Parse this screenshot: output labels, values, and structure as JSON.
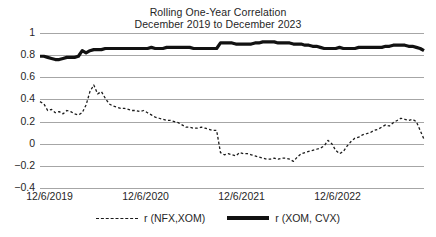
{
  "chart_data": {
    "type": "line",
    "title": "Rolling One-Year Correlation",
    "subtitle": "December 2019 to December 2023",
    "xlabel": "",
    "ylabel": "",
    "grid": true,
    "legend_position": "bottom",
    "ylim": [
      -0.4,
      1
    ],
    "yticks": [
      1,
      0.8,
      0.6,
      0.4,
      0.2,
      0,
      -0.2,
      -0.4
    ],
    "ytick_labels": [
      "1",
      "0.8",
      "0.6",
      "0.4",
      "0.2",
      "0",
      "−0.2",
      "−0.4"
    ],
    "xlim": [
      0,
      100
    ],
    "xticks": [
      2.5,
      27.5,
      52.5,
      77.5
    ],
    "xtick_labels": [
      "12/6/2019",
      "12/6/2020",
      "12/6/2021",
      "12/6/2022"
    ],
    "series": [
      {
        "name": "r (NFX,XOM)",
        "style": "dashed",
        "color": "#1a1a1a",
        "x": [
          0.0,
          1.0,
          2.0,
          3.0,
          4.0,
          5.0,
          6.0,
          7.0,
          8.0,
          9.0,
          10.0,
          11.0,
          12.0,
          13.0,
          14.0,
          15.0,
          16.0,
          17.0,
          18.0,
          19.0,
          20.0,
          21.0,
          22.0,
          23.0,
          24.0,
          25.0,
          26.0,
          27.0,
          28.0,
          29.0,
          30.0,
          31.0,
          32.0,
          33.0,
          34.0,
          35.0,
          36.0,
          37.0,
          38.0,
          39.0,
          40.0,
          41.0,
          42.0,
          43.0,
          44.0,
          45.0,
          46.0,
          47.0,
          48.0,
          49.0,
          50.0,
          51.0,
          52.0,
          53.0,
          54.0,
          55.0,
          56.0,
          57.0,
          58.0,
          59.0,
          60.0,
          61.0,
          62.0,
          63.0,
          64.0,
          65.0,
          66.0,
          67.0,
          68.0,
          69.0,
          70.0,
          71.0,
          72.0,
          73.0,
          74.0,
          75.0,
          76.0,
          77.0,
          78.0,
          79.0,
          80.0,
          81.0,
          82.0,
          83.0,
          84.0,
          85.0,
          86.0,
          87.0,
          88.0,
          89.0,
          90.0,
          91.0,
          92.0,
          93.0,
          94.0,
          95.0,
          96.0,
          97.0,
          98.0,
          99.0,
          100.0
        ],
        "values": [
          0.38,
          0.36,
          0.3,
          0.31,
          0.28,
          0.29,
          0.27,
          0.3,
          0.29,
          0.27,
          0.26,
          0.28,
          0.35,
          0.47,
          0.53,
          0.45,
          0.47,
          0.41,
          0.36,
          0.34,
          0.33,
          0.32,
          0.32,
          0.31,
          0.3,
          0.3,
          0.29,
          0.3,
          0.28,
          0.26,
          0.24,
          0.23,
          0.22,
          0.21,
          0.21,
          0.2,
          0.19,
          0.17,
          0.15,
          0.15,
          0.14,
          0.14,
          0.15,
          0.14,
          0.13,
          0.12,
          0.12,
          -0.08,
          -0.1,
          -0.09,
          -0.1,
          -0.11,
          -0.08,
          -0.09,
          -0.09,
          -0.1,
          -0.11,
          -0.12,
          -0.13,
          -0.14,
          -0.14,
          -0.13,
          -0.14,
          -0.13,
          -0.13,
          -0.14,
          -0.16,
          -0.12,
          -0.09,
          -0.08,
          -0.07,
          -0.06,
          -0.05,
          -0.04,
          -0.02,
          0.03,
          0.0,
          -0.06,
          -0.09,
          -0.07,
          -0.02,
          0.02,
          0.05,
          0.06,
          0.08,
          0.09,
          0.1,
          0.12,
          0.13,
          0.15,
          0.17,
          0.16,
          0.19,
          0.21,
          0.23,
          0.22,
          0.21,
          0.22,
          0.2,
          0.12,
          0.04
        ]
      },
      {
        "name": "r (XOM, CVX)",
        "style": "solid",
        "color": "#111111",
        "x": [
          0.0,
          1.0,
          2.0,
          3.0,
          4.0,
          5.0,
          6.0,
          7.0,
          8.0,
          9.0,
          10.0,
          11.0,
          12.0,
          13.0,
          14.0,
          15.0,
          16.0,
          17.0,
          18.0,
          19.0,
          20.0,
          21.0,
          22.0,
          23.0,
          24.0,
          25.0,
          26.0,
          27.0,
          28.0,
          29.0,
          30.0,
          31.0,
          32.0,
          33.0,
          34.0,
          35.0,
          36.0,
          37.0,
          38.0,
          39.0,
          40.0,
          41.0,
          42.0,
          43.0,
          44.0,
          45.0,
          46.0,
          47.0,
          48.0,
          49.0,
          50.0,
          51.0,
          52.0,
          53.0,
          54.0,
          55.0,
          56.0,
          57.0,
          58.0,
          59.0,
          60.0,
          61.0,
          62.0,
          63.0,
          64.0,
          65.0,
          66.0,
          67.0,
          68.0,
          69.0,
          70.0,
          71.0,
          72.0,
          73.0,
          74.0,
          75.0,
          76.0,
          77.0,
          78.0,
          79.0,
          80.0,
          81.0,
          82.0,
          83.0,
          84.0,
          85.0,
          86.0,
          87.0,
          88.0,
          89.0,
          90.0,
          91.0,
          92.0,
          93.0,
          94.0,
          95.0,
          96.0,
          97.0,
          98.0,
          99.0,
          100.0
        ],
        "values": [
          0.79,
          0.79,
          0.78,
          0.77,
          0.76,
          0.76,
          0.77,
          0.78,
          0.78,
          0.78,
          0.79,
          0.84,
          0.82,
          0.84,
          0.85,
          0.85,
          0.85,
          0.86,
          0.86,
          0.86,
          0.86,
          0.86,
          0.86,
          0.86,
          0.86,
          0.86,
          0.86,
          0.86,
          0.86,
          0.87,
          0.86,
          0.86,
          0.86,
          0.87,
          0.87,
          0.87,
          0.87,
          0.87,
          0.87,
          0.87,
          0.86,
          0.86,
          0.86,
          0.86,
          0.86,
          0.86,
          0.86,
          0.91,
          0.91,
          0.91,
          0.91,
          0.9,
          0.9,
          0.9,
          0.9,
          0.9,
          0.91,
          0.91,
          0.92,
          0.92,
          0.92,
          0.92,
          0.91,
          0.91,
          0.91,
          0.91,
          0.9,
          0.9,
          0.9,
          0.89,
          0.89,
          0.88,
          0.88,
          0.87,
          0.86,
          0.86,
          0.86,
          0.86,
          0.87,
          0.86,
          0.86,
          0.86,
          0.86,
          0.87,
          0.87,
          0.87,
          0.87,
          0.87,
          0.87,
          0.87,
          0.88,
          0.88,
          0.89,
          0.89,
          0.89,
          0.89,
          0.88,
          0.88,
          0.87,
          0.86,
          0.84
        ]
      }
    ]
  }
}
